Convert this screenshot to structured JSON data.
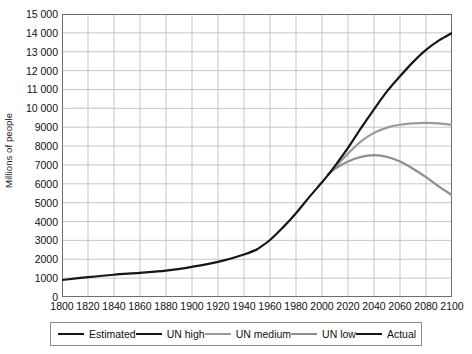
{
  "chart_data": {
    "type": "line",
    "title": "",
    "xlabel": "",
    "ylabel": "Millions of people",
    "xlim": [
      1800,
      2100
    ],
    "ylim": [
      0,
      15000
    ],
    "xticks": [
      1800,
      1820,
      1840,
      1860,
      1880,
      1900,
      1920,
      1940,
      1960,
      1980,
      2000,
      2020,
      2040,
      2060,
      2080,
      2100
    ],
    "yticks": [
      0,
      1000,
      2000,
      3000,
      4000,
      5000,
      6000,
      7000,
      8000,
      9000,
      10000,
      11000,
      12000,
      13000,
      14000,
      15000
    ],
    "ytick_labels": [
      "0",
      "1000",
      "2000",
      "3000",
      "4000",
      "5000",
      "6000",
      "7000",
      "8000",
      "9000",
      "10 000",
      "11 000",
      "12 000",
      "13 000",
      "14 000",
      "15 000"
    ],
    "grid": true,
    "legend_position": "below",
    "series": [
      {
        "name": "Estimated",
        "color": "#161616",
        "width": 2.2,
        "x": [
          1800,
          1820,
          1840,
          1860,
          1880,
          1900,
          1920,
          1940,
          1950
        ],
        "values": [
          900,
          1050,
          1180,
          1280,
          1400,
          1600,
          1860,
          2250,
          2520
        ]
      },
      {
        "name": "Actual",
        "color": "#161616",
        "width": 2.2,
        "x": [
          1950,
          1960,
          1970,
          1980,
          1990,
          2000,
          2005
        ],
        "values": [
          2520,
          3020,
          3690,
          4440,
          5280,
          6080,
          6500
        ]
      },
      {
        "name": "UN high",
        "color": "#161616",
        "width": 2.2,
        "x": [
          2005,
          2010,
          2020,
          2030,
          2040,
          2050,
          2060,
          2070,
          2080,
          2090,
          2100
        ],
        "values": [
          6500,
          6950,
          7900,
          8950,
          9950,
          10900,
          11700,
          12450,
          13100,
          13600,
          14000
        ]
      },
      {
        "name": "UN medium",
        "color": "#9a9a9a",
        "width": 2.2,
        "x": [
          2005,
          2010,
          2020,
          2030,
          2040,
          2050,
          2060,
          2070,
          2080,
          2090,
          2100
        ],
        "values": [
          6500,
          6880,
          7600,
          8250,
          8700,
          8980,
          9130,
          9200,
          9230,
          9200,
          9120
        ]
      },
      {
        "name": "UN low",
        "color": "#8e8e8e",
        "width": 2.2,
        "x": [
          2005,
          2010,
          2020,
          2030,
          2040,
          2050,
          2060,
          2070,
          2080,
          2090,
          2100
        ],
        "values": [
          6500,
          6800,
          7180,
          7430,
          7520,
          7430,
          7180,
          6800,
          6350,
          5850,
          5400
        ]
      }
    ]
  },
  "legend": {
    "items": [
      {
        "label": "Estimated",
        "color": "#161616"
      },
      {
        "label": "UN high",
        "color": "#161616"
      },
      {
        "label": "UN medium",
        "color": "#9a9a9a"
      },
      {
        "label": "UN low",
        "color": "#8e8e8e"
      },
      {
        "label": "Actual",
        "color": "#161616"
      }
    ]
  },
  "axis": {
    "y_title": "Millions of people"
  },
  "style": {
    "grid_color": "#b9b9b9",
    "frame_color": "#6e6e6e",
    "background": "#ffffff"
  }
}
